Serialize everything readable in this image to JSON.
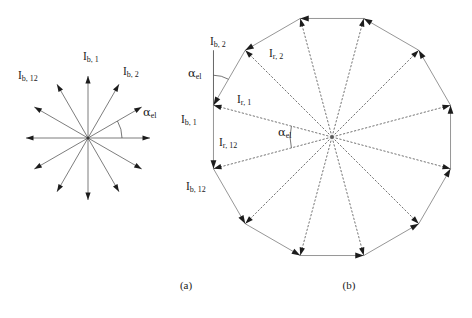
{
  "figure": {
    "background_color": "#ffffff",
    "line_color": "#6e6e6e",
    "arrow_color": "#1c1c1c",
    "text_color": "#1a1a1a"
  },
  "panel_a": {
    "caption": "(a)",
    "center": {
      "x": 88,
      "y": 138
    },
    "ray_count": 12,
    "ray_length": 62,
    "angle_step_deg": 30,
    "start_angle_deg": 0,
    "angle_arc_radius": 34,
    "labels": [
      {
        "name": "I_b,12",
        "main": "I",
        "sub": "b, 12",
        "x": 18,
        "y": 76
      },
      {
        "name": "I_b,1",
        "main": "I",
        "sub": "b, 1",
        "x": 83,
        "y": 57
      },
      {
        "name": "I_b,2",
        "main": "I",
        "sub": "b, 2",
        "x": 123,
        "y": 72
      },
      {
        "name": "alpha_el",
        "main": "α",
        "sub": "el",
        "x": 143,
        "y": 113
      }
    ]
  },
  "panel_b": {
    "caption": "(b)",
    "center": {
      "x": 332,
      "y": 137
    },
    "vertex_count": 12,
    "circumradius": 122.7,
    "apothem": 118.5,
    "first_vertex_angle_deg": 15,
    "angle_step_deg": 30,
    "labels": [
      {
        "name": "I_b,2",
        "main": "I",
        "sub": "b, 2",
        "x": 210,
        "y": 42
      },
      {
        "name": "alpha_el_vertex",
        "main": "α",
        "sub": "el",
        "x": 188,
        "y": 74
      },
      {
        "name": "I_r,2",
        "main": "I",
        "sub": "r, 2",
        "x": 269,
        "y": 54
      },
      {
        "name": "I_r,1",
        "main": "I",
        "sub": "r, 1",
        "x": 237,
        "y": 100
      },
      {
        "name": "I_b,1",
        "main": "I",
        "sub": "b, 1",
        "x": 181,
        "y": 120
      },
      {
        "name": "I_r,12",
        "main": "I",
        "sub": "r, 12",
        "x": 219,
        "y": 143
      },
      {
        "name": "alpha_el_center",
        "main": "α",
        "sub": "el",
        "x": 278,
        "y": 133
      },
      {
        "name": "I_b,12",
        "main": "I",
        "sub": "b, 12",
        "x": 186,
        "y": 187
      }
    ]
  },
  "captions": {
    "a": {
      "text": "(a)",
      "x": 186,
      "y": 289
    },
    "b": {
      "text": "(b)",
      "x": 349,
      "y": 289
    }
  }
}
